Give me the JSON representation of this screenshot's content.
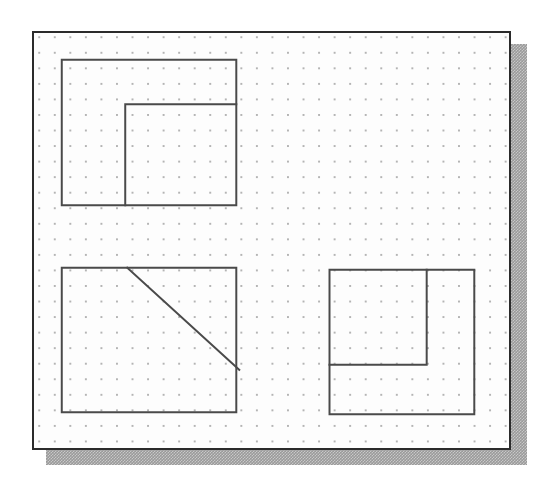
{
  "document": {
    "title": "Dot Grid Geometry Figures",
    "background_color": "#ffffff"
  },
  "canvas": {
    "name": "dot-grid-drawing-canvas",
    "x": 32,
    "y": 31,
    "width": 479,
    "height": 419,
    "background_color": "#fdfdfd",
    "border_color": "#2b2b2b",
    "border_width": 2,
    "shadow": {
      "color": "#9a9a9a",
      "offset_x": 14,
      "offset_y": 13,
      "style": "dithered-halftone"
    }
  },
  "grid": {
    "name": "dot-grid",
    "dot_color": "#b4b4b4",
    "spacing_px": 15.55,
    "dot_radius_px": 0.85,
    "origin_x": 13,
    "origin_y": 12
  },
  "figures": [
    {
      "id": "figure-top-left",
      "label": "L-shaped notched rectangle",
      "description": "Outer rectangle with an inner right-angle partition forming an L-shaped region in the upper-left",
      "outer_rect": {
        "x1": 62,
        "y1": 60,
        "x2": 238,
        "y2": 207
      },
      "paths": [
        {
          "name": "outer-rectangle",
          "d": "M 62 60 L 238 60 L 238 207 L 62 207 Z"
        },
        {
          "name": "inner-corner-line",
          "d": "M 238 105 L 126 105 L 126 207"
        }
      ]
    },
    {
      "id": "figure-bottom-left",
      "label": "Rectangle with diagonal line",
      "description": "Rectangle crossed by a diagonal segment from the top edge down to the right edge",
      "outer_rect": {
        "x1": 62,
        "y1": 270,
        "x2": 238,
        "y2": 416
      },
      "paths": [
        {
          "name": "outer-rectangle",
          "d": "M 62 270 L 238 270 L 238 416 L 62 416 Z"
        },
        {
          "name": "diagonal-line",
          "d": "M 128 270 L 241 373"
        }
      ]
    },
    {
      "id": "figure-bottom-right",
      "label": "Rectangle with inner square partition",
      "description": "Outer rectangle containing an inner right-angle partition forming a square region in the upper-left",
      "outer_rect": {
        "x1": 332,
        "y1": 272,
        "x2": 478,
        "y2": 418
      },
      "paths": [
        {
          "name": "outer-rectangle",
          "d": "M 332 272 L 478 272 L 478 418 L 332 418 Z"
        },
        {
          "name": "inner-corner-line",
          "d": "M 430 272 L 430 368 L 332 368"
        }
      ]
    }
  ],
  "style": {
    "figure_stroke_color": "#4a4a4a",
    "figure_stroke_width": 2
  }
}
